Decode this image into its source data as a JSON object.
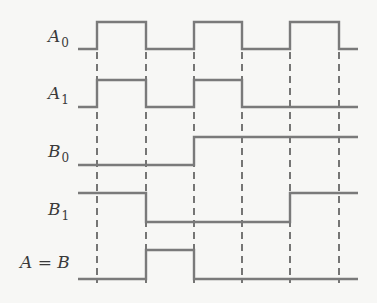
{
  "diagram": {
    "type": "timing-diagram",
    "colors": {
      "wave": "#7a7a7a",
      "dash": "#555555",
      "background": "#f7f7f5",
      "text": "#3a3a3a"
    },
    "x_start": 78,
    "x_end": 358,
    "transitions_x": [
      97,
      146,
      194,
      242,
      290,
      339
    ],
    "dash_y": [
      52,
      283
    ],
    "signals": [
      {
        "name": "A0",
        "label_main": "A",
        "label_sub": "0",
        "label_x": 48,
        "label_y": 42,
        "y_low": 49,
        "y_high": 22,
        "levels": [
          0,
          1,
          0,
          1,
          0,
          1,
          0
        ]
      },
      {
        "name": "A1",
        "label_main": "A",
        "label_sub": "1",
        "label_x": 48,
        "label_y": 99,
        "y_low": 107,
        "y_high": 80,
        "levels": [
          0,
          1,
          0,
          1,
          0,
          0,
          0
        ]
      },
      {
        "name": "B0",
        "label_main": "B",
        "label_sub": "0",
        "label_x": 48,
        "label_y": 157,
        "y_low": 165,
        "y_high": 137,
        "levels": [
          0,
          0,
          0,
          1,
          1,
          1,
          1
        ]
      },
      {
        "name": "B1",
        "label_main": "B",
        "label_sub": "1",
        "label_x": 48,
        "label_y": 215,
        "y_low": 222,
        "y_high": 193,
        "levels": [
          1,
          1,
          0,
          0,
          0,
          1,
          1
        ]
      },
      {
        "name": "A=B",
        "label_main": "A = B",
        "label_sub": "",
        "label_x": 20,
        "label_y": 268,
        "y_low": 279,
        "y_high": 250,
        "levels": [
          0,
          0,
          1,
          0,
          0,
          0,
          0
        ]
      }
    ]
  }
}
